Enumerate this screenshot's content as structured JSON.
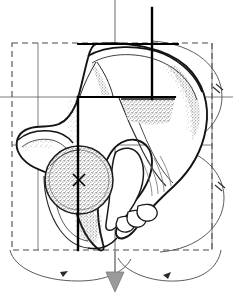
{
  "figure": {
    "title": "Hip bone (os coxae) lateral view with geometric construction overlay",
    "view": "lateral",
    "background_color": "#ffffff",
    "ink_color": "#1a1a1a",
    "construction_color": "#3a3a3a",
    "axis_color": "#000000",
    "guide_color": "#8a8a8a",
    "stipple_color": "#5a5a5a",
    "arrow_fill": "#9a9a9a",
    "canvas": {
      "width": 233,
      "height": 302
    }
  },
  "construction": {
    "bounding_box": {
      "label": "dashed bounding box",
      "x": 12,
      "y": 43,
      "width": 200,
      "height": 207,
      "stroke": "#4a4a4a",
      "dash": "6 4"
    },
    "grid_lines": [
      {
        "name": "horizontal-upper",
        "orientation": "horizontal",
        "y": 97,
        "x1": 0,
        "x2": 233
      },
      {
        "name": "horizontal-lower",
        "orientation": "horizontal",
        "y": 145,
        "x1": 12,
        "x2": 212
      },
      {
        "name": "vertical-left",
        "orientation": "vertical",
        "x": 38,
        "y1": 43,
        "y2": 250
      },
      {
        "name": "vertical-center",
        "orientation": "vertical",
        "x": 115,
        "y1": 0,
        "y2": 268
      },
      {
        "name": "vertical-right",
        "orientation": "vertical",
        "x": 212,
        "y1": 43,
        "y2": 250
      }
    ],
    "axes": [
      {
        "name": "primary-vertical-axis",
        "x": 78,
        "y1": 97,
        "y2": 250,
        "weight": "heavy"
      },
      {
        "name": "secondary-vertical-axis",
        "x": 152,
        "y1": 8,
        "y2": 97,
        "weight": "heavy"
      },
      {
        "name": "horizontal-shelf-axis",
        "y": 97,
        "x1": 78,
        "x2": 175,
        "weight": "heavy"
      },
      {
        "name": "drop-axis",
        "x": 115,
        "y1": 0,
        "y2": 268,
        "weight": "light"
      }
    ],
    "direction_arrow": {
      "name": "downward-axis-arrow",
      "x": 115,
      "y_start": 252,
      "y_tip": 290,
      "head_width": 18,
      "head_height": 20,
      "fill": "#9a9a9a"
    },
    "rotation_arcs": [
      {
        "name": "arc-left-bottom",
        "cx": 78,
        "cy": 150,
        "rx": 70,
        "ry": 105,
        "arrow_at": "bottom",
        "tick_marks": 0
      },
      {
        "name": "arc-right-bottom",
        "cx": 152,
        "cy": 150,
        "rx": 62,
        "ry": 105,
        "arrow_at": "bottom",
        "tick_marks": 0
      },
      {
        "name": "arc-right-upper",
        "cx": 152,
        "cy": 97,
        "rx": 70,
        "ry": 56,
        "arrow_at": "none",
        "tick_marks": 2
      },
      {
        "name": "arc-right-lower",
        "cx": 152,
        "cy": 198,
        "rx": 70,
        "ry": 56,
        "arrow_at": "none",
        "tick_marks": 2
      },
      {
        "name": "arc-iliac-left",
        "cx": 96,
        "cy": 92,
        "rx": 18,
        "ry": 9,
        "arrow_at": "none",
        "tick_marks": 2
      },
      {
        "name": "arc-iliac-right",
        "cx": 138,
        "cy": 92,
        "rx": 20,
        "ry": 9,
        "arrow_at": "none",
        "tick_marks": 2
      }
    ],
    "acetabulum": {
      "name": "acetabulum-circle",
      "cx": 79,
      "cy": 180,
      "r": 34,
      "fill_pattern": "stipple",
      "center_marker": "x-cross",
      "stroke": "#2a2a2a"
    }
  },
  "anatomy": {
    "regions": [
      {
        "name": "iliac-crest",
        "note": "superior arched border of ilium"
      },
      {
        "name": "iliac-fossa",
        "note": "broad concave ala of ilium"
      },
      {
        "name": "anterior-superior-iliac-spine",
        "note": "left anterior projection"
      },
      {
        "name": "acetabulum",
        "note": "stippled cup for femoral head"
      },
      {
        "name": "obturator-foramen",
        "note": "large inferior opening"
      },
      {
        "name": "ischial-tuberosity",
        "note": "inferior posterior mass"
      },
      {
        "name": "pubic-ramus",
        "note": "finger-like inferior rami"
      },
      {
        "name": "ischial-spine",
        "note": "posterior pointed process"
      }
    ],
    "shading": "stipple-and-hatch"
  },
  "labels": {
    "visible_text": []
  }
}
